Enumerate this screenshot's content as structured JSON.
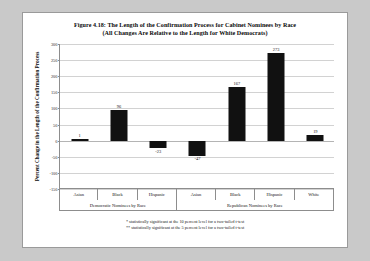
{
  "figure": {
    "title_line1": "Figure 4.18: The Length of the Confirmation Process for Cabinet Nominees by Race",
    "title_line2": "(All Changes Are Relative to the Length for White Democrats)",
    "note1": "* statistically significant at the 10 percent level for a two-tailed t-test",
    "note2": "** statistically significant at the 5 percent level for a two-tailed t-test",
    "bar_color": "#111111",
    "grid_color": "#d2d2d2",
    "axis_color": "#8d8d8d"
  },
  "chart_data": {
    "type": "bar",
    "title": "Figure 4.18: The Length of the Confirmation Process for Cabinet Nominees by Race (All Changes Are Relative to the Length for White Democrats)",
    "xlabel": "",
    "ylabel": "Percent Change in the Length of the Confirmation Process",
    "ylim": [
      -150,
      300
    ],
    "yticks": [
      300,
      250,
      200,
      150,
      100,
      50,
      0,
      -50,
      -100,
      -150
    ],
    "ytick_labels": [
      "300",
      "250",
      "200",
      "150",
      "100",
      "50",
      "0",
      "-50",
      "-100",
      "-150"
    ],
    "grid": true,
    "legend": "none",
    "categories": [
      "Asian",
      "Black",
      "Hispanic",
      "Asian",
      "Black",
      "Hispanic",
      "White"
    ],
    "values": [
      1,
      96,
      -23,
      -47,
      167,
      273,
      19
    ],
    "data_labels": [
      "1",
      "96",
      "-23",
      "-47",
      "167",
      "273",
      "19"
    ],
    "groups": [
      {
        "label": "Democratic Nominees by Race",
        "span": 3
      },
      {
        "label": "Republican Nominees by Race",
        "span": 4
      }
    ]
  }
}
